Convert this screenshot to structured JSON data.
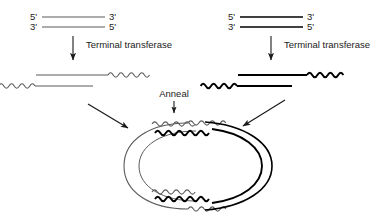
{
  "figure": {
    "background_color": "#ffffff",
    "thin_stroke_color": "#5a5a5a",
    "thick_stroke_color": "#000000",
    "text_color": "#1a1a1a"
  },
  "left_pathway": {
    "duplex": {
      "top_strand_left_label": "5'",
      "top_strand_right_label": "3'",
      "bottom_strand_left_label": "3'",
      "bottom_strand_right_label": "5'",
      "line_weight": "thin"
    },
    "reaction_label": "Terminal transferase",
    "tailed_product": {
      "top_strand_tail_side": "right",
      "bottom_strand_tail_side": "left",
      "line_weight": "thin"
    }
  },
  "right_pathway": {
    "duplex": {
      "top_strand_left_label": "5'",
      "top_strand_right_label": "3'",
      "bottom_strand_left_label": "3'",
      "bottom_strand_right_label": "5'",
      "line_weight": "thick"
    },
    "reaction_label": "Terminal transferase",
    "tailed_product": {
      "top_strand_tail_side": "right",
      "bottom_strand_tail_side": "left",
      "line_weight": "thick"
    }
  },
  "anneal_step": {
    "label": "Anneal",
    "product_description": "circular hybrid of thin and thick strands joined at two wavy homopolymer tail junctions"
  }
}
